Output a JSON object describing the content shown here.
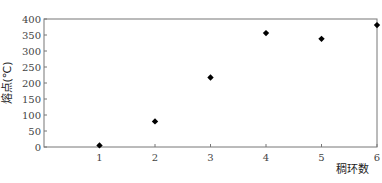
{
  "chart_data": {
    "type": "scatter",
    "title": "",
    "xlabel": "稠环数",
    "ylabel": "熔点(℃)",
    "x": [
      1,
      2,
      3,
      4,
      5,
      6
    ],
    "values": [
      5,
      80,
      217,
      356,
      338,
      381
    ],
    "series": [
      {
        "name": "熔点",
        "x": [
          1,
          2,
          3,
          4,
          5,
          6
        ],
        "values": [
          5,
          80,
          217,
          356,
          338,
          381
        ],
        "marker": "diamond",
        "color": "#000000"
      }
    ],
    "xticks": [
      "1",
      "2",
      "3",
      "4",
      "5",
      "6"
    ],
    "yticks": [
      "0",
      "50",
      "100",
      "150",
      "200",
      "250",
      "300",
      "350",
      "400"
    ],
    "xlim": [
      0,
      6
    ],
    "ylim": [
      0,
      400
    ],
    "grid": false,
    "legend": "none"
  }
}
